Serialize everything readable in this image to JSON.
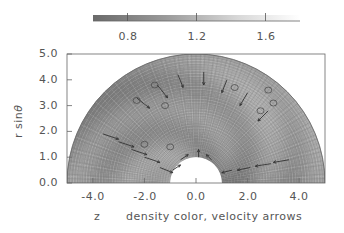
{
  "chart_data": {
    "type": "heatmap",
    "subtype": "polar-mesh (half-disk) with velocity arrows",
    "title": "",
    "xlabel": "z",
    "xlabel_caption": "density color, velocity arrows",
    "ylabel": "r sinθ",
    "xlim": [
      -5.0,
      5.0
    ],
    "ylim": [
      0.0,
      5.0
    ],
    "x_ticks": [
      "-4.0",
      "-2.0",
      "0.0",
      "2.0",
      "4.0"
    ],
    "x_tick_values": [
      -4.0,
      -2.0,
      0.0,
      2.0,
      4.0
    ],
    "y_ticks": [
      "0.0",
      "1.0",
      "2.0",
      "3.0",
      "4.0",
      "5.0"
    ],
    "y_tick_values": [
      0.0,
      1.0,
      2.0,
      3.0,
      4.0,
      5.0
    ],
    "domain": {
      "inner_radius": 1.0,
      "outer_radius": 5.0,
      "theta_range_deg": [
        0,
        180
      ]
    },
    "colorbar": {
      "orientation": "horizontal",
      "position": "top",
      "range": [
        0.6,
        1.8
      ],
      "ticks": [
        "0.8",
        "1.2",
        "1.6"
      ],
      "tick_values": [
        0.8,
        1.2,
        1.6
      ],
      "colormap": "dark-gray (low) to white (high)"
    },
    "grid": false,
    "legend": "none"
  },
  "labels": {
    "ylabel_main": "r sin",
    "ylabel_theta": "θ",
    "xlabel": "z",
    "caption": "density color, velocity arrows"
  }
}
